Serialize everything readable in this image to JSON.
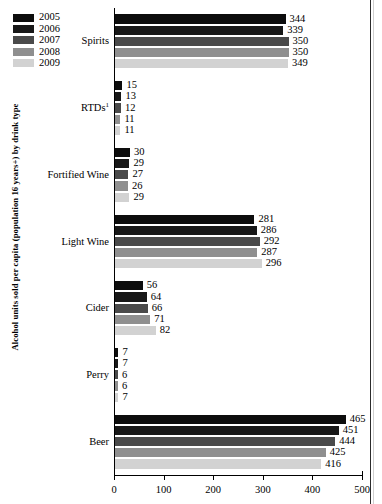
{
  "chart_data": {
    "type": "bar",
    "orientation": "horizontal",
    "title": "",
    "xlabel": "",
    "ylabel": "Alcohol units sold per capita (population 16 years+) by drink type",
    "xlim": [
      0,
      500
    ],
    "xticks": [
      0,
      100,
      200,
      300,
      400,
      500
    ],
    "grid": false,
    "legend_position": "top-left",
    "footnote_marker": "1",
    "categories": [
      "Spirits",
      "RTDs",
      "Fortified Wine",
      "Light Wine",
      "Cider",
      "Perry",
      "Beer"
    ],
    "category_labels": [
      "Spirits",
      "RTDs¹",
      "Fortified Wine",
      "Light Wine",
      "Cider",
      "Perry",
      "Beer"
    ],
    "series": [
      {
        "name": "2005",
        "color": "#0d0d0d",
        "values": [
          344,
          15,
          30,
          281,
          56,
          7,
          465
        ]
      },
      {
        "name": "2006",
        "color": "#181818",
        "values": [
          339,
          13,
          29,
          286,
          64,
          7,
          451
        ]
      },
      {
        "name": "2007",
        "color": "#4a4a4a",
        "values": [
          350,
          12,
          27,
          292,
          66,
          6,
          444
        ]
      },
      {
        "name": "2008",
        "color": "#8f8f8f",
        "values": [
          350,
          11,
          26,
          287,
          71,
          6,
          425
        ]
      },
      {
        "name": "2009",
        "color": "#d2d2d2",
        "values": [
          349,
          11,
          29,
          296,
          82,
          7,
          416
        ]
      }
    ]
  },
  "legend": {
    "items": [
      {
        "label": "2005"
      },
      {
        "label": "2006"
      },
      {
        "label": "2007"
      },
      {
        "label": "2008"
      },
      {
        "label": "2009"
      }
    ]
  },
  "axis": {
    "tick_labels": [
      "0",
      "100",
      "200",
      "300",
      "400",
      "500"
    ]
  },
  "groups": [
    {
      "label": "Spirits",
      "values": [
        "344",
        "339",
        "350",
        "350",
        "349"
      ]
    },
    {
      "label": "RTDs",
      "label_sup": "1",
      "values": [
        "15",
        "13",
        "12",
        "11",
        "11"
      ]
    },
    {
      "label": "Fortified Wine",
      "values": [
        "30",
        "29",
        "27",
        "26",
        "29"
      ]
    },
    {
      "label": "Light Wine",
      "values": [
        "281",
        "286",
        "292",
        "287",
        "296"
      ]
    },
    {
      "label": "Cider",
      "values": [
        "56",
        "64",
        "66",
        "71",
        "82"
      ]
    },
    {
      "label": "Perry",
      "values": [
        "7",
        "7",
        "6",
        "6",
        "7"
      ]
    },
    {
      "label": "Beer",
      "values": [
        "465",
        "451",
        "444",
        "425",
        "416"
      ]
    }
  ]
}
